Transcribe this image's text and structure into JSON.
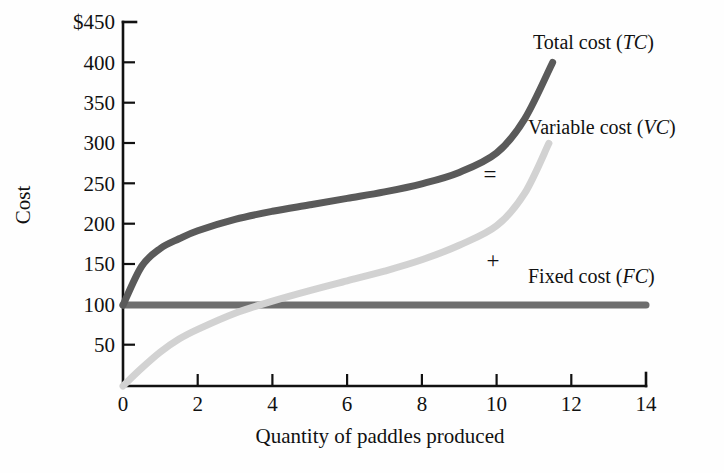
{
  "chart_data": {
    "type": "line",
    "title": "",
    "xlabel": "Quantity of paddles produced",
    "ylabel": "Cost",
    "xlim": [
      0,
      14
    ],
    "ylim": [
      0,
      450
    ],
    "grid": false,
    "legend_position": "right-inline",
    "x_ticks": [
      "0",
      "2",
      "4",
      "6",
      "8",
      "10",
      "12",
      "14"
    ],
    "x_tick_values": [
      0,
      2,
      4,
      6,
      8,
      10,
      12,
      14
    ],
    "y_ticks": [
      "$450",
      "400",
      "350",
      "300",
      "250",
      "200",
      "150",
      "100",
      "50"
    ],
    "y_tick_values": [
      450,
      400,
      350,
      300,
      250,
      200,
      150,
      100,
      50
    ],
    "series": [
      {
        "name": "Total cost (TC)",
        "label_text": "Total cost (",
        "label_abbr": "TC",
        "label_close": ")",
        "color": "#5a5a5a",
        "x": [
          0,
          0.5,
          1.0,
          1.5,
          2.0,
          3.0,
          4.0,
          5.0,
          6.0,
          7.0,
          8.0,
          9.0,
          10.0,
          10.75,
          11.5
        ],
        "values": [
          100,
          148,
          170,
          182,
          192,
          206,
          216,
          224,
          232,
          240,
          250,
          264,
          288,
          330,
          400
        ]
      },
      {
        "name": "Variable cost (VC)",
        "label_text": "Variable cost (",
        "label_abbr": "VC",
        "label_close": ")",
        "color": "#d2d2d2",
        "x": [
          0,
          0.5,
          1.0,
          1.5,
          2.0,
          3.0,
          4.0,
          5.0,
          6.0,
          7.0,
          8.0,
          9.0,
          10.0,
          10.75,
          11.4
        ],
        "values": [
          0,
          22,
          42,
          58,
          70,
          90,
          105,
          118,
          130,
          142,
          156,
          174,
          198,
          238,
          300
        ]
      },
      {
        "name": "Fixed cost (FC)",
        "label_text": "Fixed cost (",
        "label_abbr": "FC",
        "label_close": ")",
        "color": "#6e6e6e",
        "x": [
          0,
          14
        ],
        "values": [
          100,
          100
        ]
      }
    ],
    "annotations": [
      {
        "text": "=",
        "x": 10.0,
        "y": 255
      },
      {
        "text": "+",
        "x": 10.05,
        "y": 150
      }
    ]
  }
}
